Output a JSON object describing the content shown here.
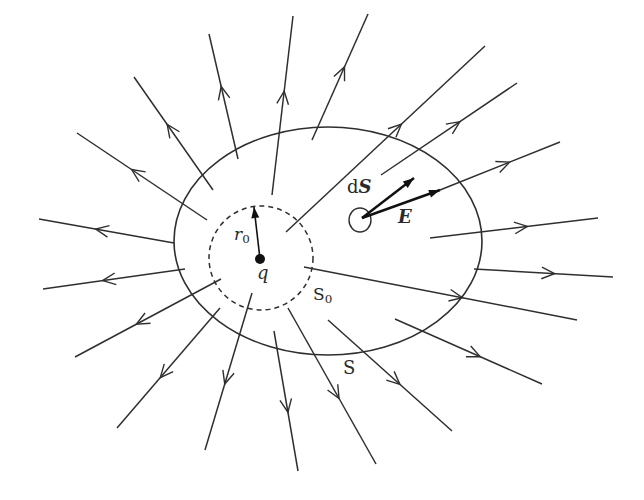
{
  "diagram": {
    "colors": {
      "line": "#2f2f2f",
      "background": "#ffffff"
    },
    "labels": {
      "charge": "q",
      "radius_var": "r",
      "radius_sub": "0",
      "inner_surface": "S",
      "inner_surface_sub": "0",
      "outer_surface": "S",
      "area_element_d": "d",
      "area_element_S": "S",
      "field": "E"
    },
    "charge": {
      "x": 260,
      "y": 259,
      "r": 5
    },
    "inner_sphere": {
      "cx": 261,
      "cy": 258,
      "r": 52,
      "style": "dashed"
    },
    "outer_surface": {
      "cx": 328,
      "cy": 241,
      "rx": 154,
      "ry": 114,
      "style": "solid"
    },
    "radius_arrow": {
      "x1": 260,
      "y1": 259,
      "x2": 254,
      "y2": 207
    },
    "area_element": {
      "cx": 360,
      "cy": 220,
      "rx": 11,
      "ry": 12
    },
    "dS_arrow": {
      "x1": 362,
      "y1": 218,
      "x2": 414,
      "y2": 178
    },
    "E_arrow": {
      "x1": 362,
      "y1": 218,
      "x2": 440,
      "y2": 190
    },
    "field_lines": [
      {
        "x1": 213,
        "y1": 190,
        "x2": 134,
        "y2": 77
      },
      {
        "x1": 207,
        "y1": 220,
        "x2": 77,
        "y2": 133
      },
      {
        "x1": 174,
        "y1": 243,
        "x2": 39,
        "y2": 219
      },
      {
        "x1": 238,
        "y1": 159,
        "x2": 209,
        "y2": 34
      },
      {
        "x1": 272,
        "y1": 195,
        "x2": 293,
        "y2": 16
      },
      {
        "x1": 312,
        "y1": 140,
        "x2": 368,
        "y2": 14
      },
      {
        "x1": 286,
        "y1": 232,
        "x2": 485,
        "y2": 46
      },
      {
        "x1": 381,
        "y1": 175,
        "x2": 517,
        "y2": 83
      },
      {
        "x1": 440,
        "y1": 190,
        "x2": 560,
        "y2": 142
      },
      {
        "x1": 430,
        "y1": 238,
        "x2": 598,
        "y2": 218
      },
      {
        "x1": 474,
        "y1": 269,
        "x2": 613,
        "y2": 277
      },
      {
        "x1": 304,
        "y1": 267,
        "x2": 577,
        "y2": 320
      },
      {
        "x1": 395,
        "y1": 319,
        "x2": 542,
        "y2": 384
      },
      {
        "x1": 328,
        "y1": 320,
        "x2": 452,
        "y2": 431
      },
      {
        "x1": 288,
        "y1": 308,
        "x2": 376,
        "y2": 464
      },
      {
        "x1": 274,
        "y1": 331,
        "x2": 298,
        "y2": 471
      },
      {
        "x1": 252,
        "y1": 293,
        "x2": 205,
        "y2": 450
      },
      {
        "x1": 220,
        "y1": 308,
        "x2": 117,
        "y2": 428
      },
      {
        "x1": 221,
        "y1": 279,
        "x2": 75,
        "y2": 357
      },
      {
        "x1": 185,
        "y1": 269,
        "x2": 43,
        "y2": 289
      }
    ]
  }
}
